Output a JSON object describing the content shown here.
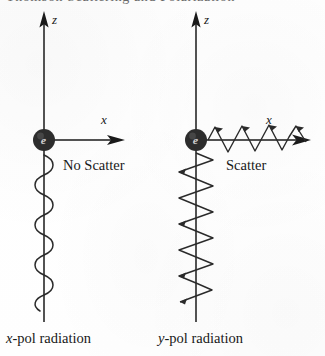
{
  "page": {
    "width": 325,
    "height": 356,
    "background_color": "#ffffff",
    "ink_color": "#1a1a1a",
    "cropped_header_text": "Thomson Scattering and Polarization"
  },
  "panels": [
    {
      "id": "left",
      "z_axis_label": "z",
      "x_axis_label": "x",
      "particle_label": "e",
      "state_label": "No Scatter",
      "caption_var": "x",
      "caption_rest": "-pol radiation",
      "caption_full": "x-pol radiation",
      "incoming_wave": "vertical-sinusoid",
      "scattered_wave": "none"
    },
    {
      "id": "right",
      "z_axis_label": "z",
      "x_axis_label": "x",
      "particle_label": "e",
      "state_label": "Scatter",
      "caption_var": "y",
      "caption_rest": "-pol radiation",
      "caption_full": "y-pol radiation",
      "incoming_wave": "skewed-sinusoid",
      "scattered_wave": "skewed-sinusoid-along-x"
    }
  ],
  "geometry": {
    "left_axis_x": 44,
    "right_axis_x": 196,
    "electron_y": 140,
    "electron_radius": 11,
    "z_arrow_tip_y": 12,
    "axis_bottom_y": 322,
    "left_x_arrow_end": 124,
    "right_x_arrow_end": 310
  },
  "colors": {
    "ink": "#1a1a1a",
    "electron_fill": "#2d2d2d",
    "electron_label": "#e8e8e8",
    "paper": "#ffffff",
    "faded_header": "#4a4a4a"
  },
  "icons": {
    "z_arrowhead": "arrow-up-icon",
    "x_arrowhead": "arrow-right-icon",
    "electron": "electron-icon"
  }
}
